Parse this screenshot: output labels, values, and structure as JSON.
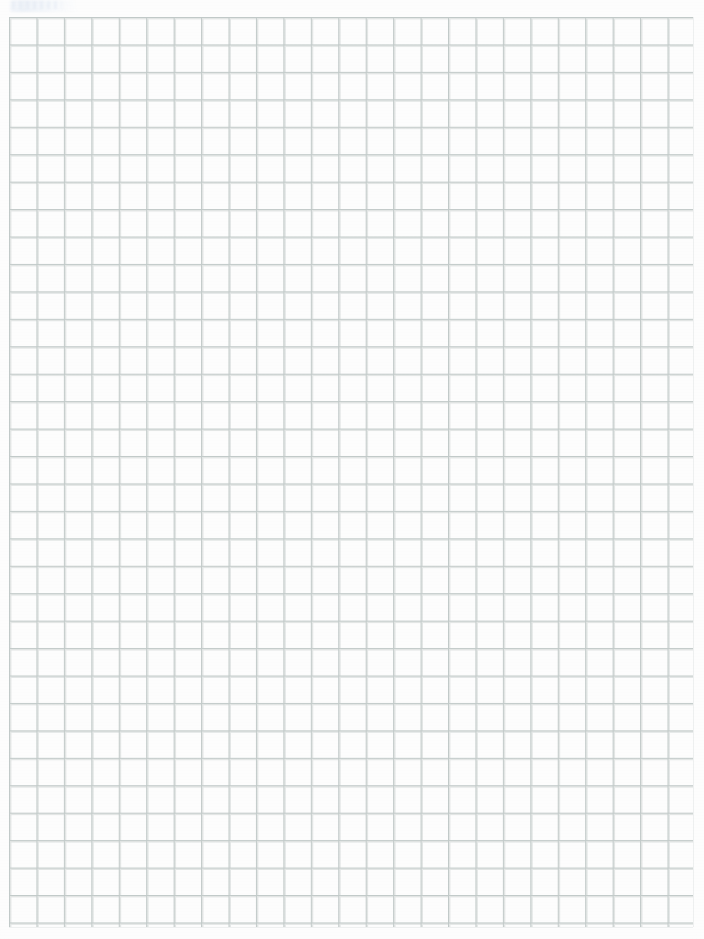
{
  "document": {
    "kind": "scanned-grid-paper",
    "page_width": 704,
    "page_height": 939,
    "background_color": "#fdfdfd",
    "has_text_content": false,
    "has_handwriting": false
  },
  "grid": {
    "line_color": "#ced4d3",
    "line_color_strong": "#c2cac9",
    "line_width": 1,
    "cell_size": 27.45,
    "left": 9,
    "top": 17,
    "right": 693,
    "bottom": 927,
    "columns": 25,
    "rows": 33,
    "style": "square-grid"
  },
  "artifacts": {
    "corner_smudge": {
      "name": "scan-smudge",
      "color": "#eef2f8",
      "left": 10,
      "top": 0,
      "width": 66,
      "height": 12
    },
    "vignette_color": "#f6f7f8",
    "grain_opacity": 0.35
  },
  "margins": {
    "left_margin": 9,
    "right_margin": 11,
    "top_margin": 17,
    "bottom_margin": 12
  }
}
